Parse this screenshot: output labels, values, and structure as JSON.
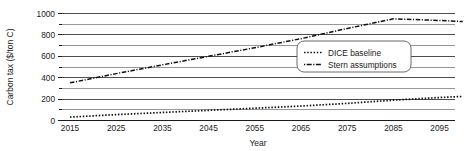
{
  "chart_data": {
    "type": "line",
    "title": "",
    "xlabel": "Year",
    "ylabel": "Carbon tax ($/ton C)",
    "xlim": [
      2015,
      2100
    ],
    "ylim": [
      0,
      1000
    ],
    "grid": true,
    "grid_interval": 100,
    "legend_position": "center-right",
    "xticks": [
      2015,
      2025,
      2035,
      2045,
      2055,
      2065,
      2075,
      2085,
      2095
    ],
    "xtick_labels": [
      "2015",
      "2025",
      "2035",
      "2045",
      "2055",
      "2065",
      "2075",
      "2085",
      "2095"
    ],
    "yticks": [
      0,
      200,
      400,
      600,
      800,
      1000
    ],
    "ytick_labels": [
      "0",
      "200",
      "400",
      "600",
      "800",
      "1000"
    ],
    "x": [
      2015,
      2025,
      2035,
      2045,
      2055,
      2065,
      2075,
      2085,
      2095,
      2100
    ],
    "series": [
      {
        "name": "DICE baseline",
        "style": "dotted",
        "color": "#111111",
        "values": [
          32,
          55,
          75,
          95,
          115,
          135,
          160,
          190,
          215,
          225
        ]
      },
      {
        "name": "Stern assumptions",
        "style": "dash-dot",
        "color": "#111111",
        "values": [
          352,
          438,
          520,
          600,
          680,
          765,
          860,
          950,
          935,
          925
        ]
      }
    ]
  },
  "legend": {
    "entries": [
      {
        "label": "DICE baseline",
        "marker": "dotted-line"
      },
      {
        "label": "Stern assumptions",
        "marker": "dash-dot-line"
      }
    ]
  },
  "axes": {
    "y_title": "Carbon tax ($/ton C)",
    "x_title": "Year"
  }
}
